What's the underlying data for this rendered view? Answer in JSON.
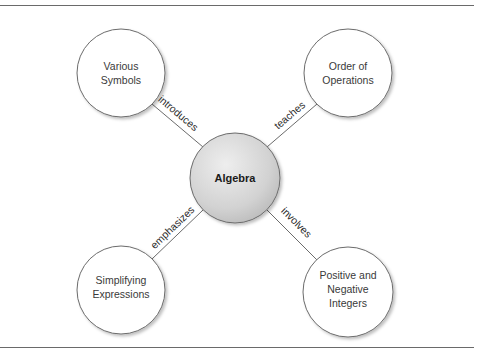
{
  "diagram": {
    "type": "concept-map",
    "center": {
      "label": "Algebra",
      "fill": "#d6d6d6"
    },
    "nodes": [
      {
        "id": "various-symbols",
        "lines": [
          "Various",
          "Symbols"
        ],
        "edge_label": "introduces"
      },
      {
        "id": "order-of-operations",
        "lines": [
          "Order of",
          "Operations"
        ],
        "edge_label": "teaches"
      },
      {
        "id": "simplifying-expressions",
        "lines": [
          "Simplifying",
          "Expressions"
        ],
        "edge_label": "emphasizes"
      },
      {
        "id": "positive-negative-integers",
        "lines": [
          "Positive and",
          "Negative",
          "Integers"
        ],
        "edge_label": "involves"
      }
    ],
    "colors": {
      "stroke": "#6b6b6b",
      "node_fill": "#ffffff",
      "rule": "#6a6a6a"
    }
  }
}
